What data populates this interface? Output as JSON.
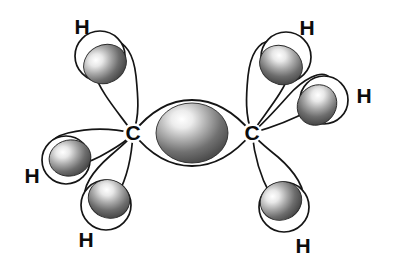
{
  "figure": {
    "molecule": "C2H6",
    "background_color": "#ffffff",
    "line_color": "#151515",
    "sphere_dark_color": "#4a4a4a",
    "sphere_light_color": "#ffffff",
    "label_color": "#0c0c0c"
  },
  "atoms": {
    "carbons": [
      {
        "id": "carbon-left",
        "label": "C",
        "x": 133,
        "y": 133
      },
      {
        "id": "carbon-right",
        "label": "C",
        "x": 252,
        "y": 133
      }
    ],
    "hydrogens": [
      {
        "id": "hydrogen-top-left",
        "label": "H",
        "x": 82,
        "y": 28
      },
      {
        "id": "hydrogen-left",
        "label": "H",
        "x": 32,
        "y": 177
      },
      {
        "id": "hydrogen-bottom-left",
        "label": "H",
        "x": 86,
        "y": 241
      },
      {
        "id": "hydrogen-top-right",
        "label": "H",
        "x": 307,
        "y": 29
      },
      {
        "id": "hydrogen-right",
        "label": "H",
        "x": 364,
        "y": 97
      },
      {
        "id": "hydrogen-bottom-right",
        "label": "H",
        "x": 303,
        "y": 247
      }
    ]
  },
  "bonds": {
    "sigma_cc": {
      "id": "sigma-bond-carbon-carbon",
      "center_x": 192,
      "center_y": 133,
      "sphere_rx": 36,
      "sphere_ry": 30
    },
    "sigma_ch_count": 6
  },
  "orbital_lobes": [
    {
      "id": "lobe-top-left",
      "sphere_x": 105,
      "sphere_y": 64,
      "sphere_rx": 22,
      "sphere_ry": 19,
      "h_circle_x": 100,
      "h_circle_y": 56,
      "h_circle_r": 25
    },
    {
      "id": "lobe-left",
      "sphere_x": 70,
      "sphere_y": 158,
      "sphere_rx": 21,
      "sphere_ry": 18,
      "h_circle_x": 66,
      "h_circle_y": 160,
      "h_circle_r": 24
    },
    {
      "id": "lobe-bottom-left",
      "sphere_x": 109,
      "sphere_y": 199,
      "sphere_rx": 21,
      "sphere_ry": 19,
      "h_circle_x": 106,
      "h_circle_y": 205,
      "h_circle_r": 25
    },
    {
      "id": "lobe-top-right",
      "sphere_x": 281,
      "sphere_y": 65,
      "sphere_rx": 22,
      "sphere_ry": 19,
      "h_circle_x": 286,
      "h_circle_y": 57,
      "h_circle_r": 25
    },
    {
      "id": "lobe-right",
      "sphere_x": 317,
      "sphere_y": 105,
      "sphere_rx": 19,
      "sphere_ry": 21,
      "h_circle_x": 324,
      "h_circle_y": 100,
      "h_circle_r": 24
    },
    {
      "id": "lobe-bottom-right",
      "sphere_x": 281,
      "sphere_y": 201,
      "sphere_rx": 21,
      "sphere_ry": 19,
      "h_circle_x": 284,
      "h_circle_y": 207,
      "h_circle_r": 25
    }
  ]
}
